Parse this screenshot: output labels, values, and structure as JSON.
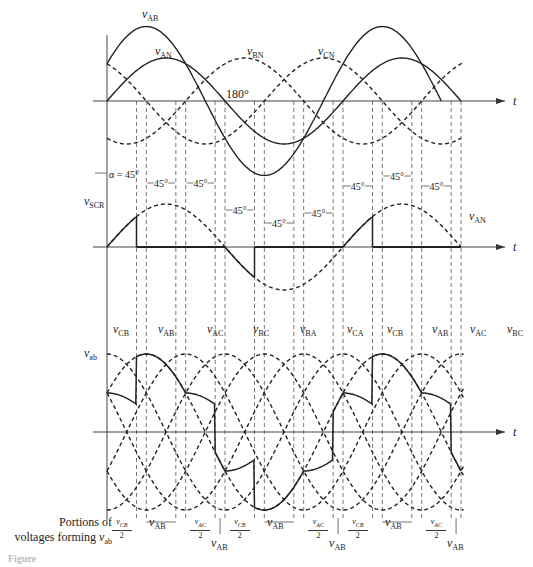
{
  "figure": {
    "caption_label": "Portions of",
    "caption_label_2": "voltages forming",
    "caption_var": "v",
    "caption_sub": "ab",
    "figure_caption": "Figure"
  },
  "panel_top": {
    "labels": {
      "vAB": {
        "v": "v",
        "sub": "AB"
      },
      "vAN": {
        "v": "v",
        "sub": "AN"
      },
      "vBN": {
        "v": "v",
        "sub": "BN"
      },
      "vCN": {
        "v": "v",
        "sub": "CN"
      },
      "deg180": "180°",
      "t": "t"
    }
  },
  "panel_scr": {
    "labels": {
      "alpha": "α = 45°",
      "vSCR": {
        "v": "v",
        "sub": "SCR"
      },
      "vAN": {
        "v": "v",
        "sub": "AN"
      },
      "t": "t",
      "intervals": [
        "45°",
        "45°",
        "45°",
        "45°",
        "45°",
        "45°",
        "45°",
        "45°",
        "45°"
      ]
    }
  },
  "panel_vab": {
    "labels": {
      "vab": {
        "v": "v",
        "sub": "ab"
      },
      "t": "t",
      "curves": [
        "CB",
        "AB",
        "AC",
        "BC",
        "BA",
        "CA",
        "CB",
        "AB",
        "AC",
        "BC"
      ]
    },
    "portions": [
      {
        "type": "half",
        "num": "v",
        "sub": "CB",
        "den": "2"
      },
      {
        "type": "full",
        "v": "v",
        "sub": "AB"
      },
      {
        "type": "half",
        "num": "v",
        "sub": "AC",
        "den": "2"
      },
      {
        "type": "arrow",
        "v": "v",
        "sub": "AB"
      },
      {
        "type": "half",
        "num": "v",
        "sub": "CB",
        "den": "2"
      },
      {
        "type": "full",
        "v": "v",
        "sub": "AB"
      },
      {
        "type": "half",
        "num": "v",
        "sub": "AC",
        "den": "2"
      },
      {
        "type": "arrow",
        "v": "v",
        "sub": "AB"
      },
      {
        "type": "half",
        "num": "v",
        "sub": "CB",
        "den": "2"
      },
      {
        "type": "full",
        "v": "v",
        "sub": "AB"
      },
      {
        "type": "half",
        "num": "v",
        "sub": "AC",
        "den": "2"
      },
      {
        "type": "arrow",
        "v": "v",
        "sub": "AB"
      }
    ]
  },
  "chart_data": {
    "type": "line",
    "xlabel": "t",
    "x_unit": "degrees",
    "x_range": [
      0,
      540
    ],
    "dashed_verticals_deg": [
      45,
      60,
      105,
      120,
      165,
      180,
      225,
      240,
      285,
      300,
      345,
      360,
      405,
      420,
      465,
      480,
      525,
      540
    ],
    "series": [
      {
        "panel": "top",
        "name": "v_AN",
        "style": "solid",
        "amplitude": 1.0,
        "phase_deg": 0
      },
      {
        "panel": "top",
        "name": "v_AB",
        "style": "solid",
        "amplitude": 1.732,
        "phase_deg": 30
      },
      {
        "panel": "top",
        "name": "v_BN",
        "style": "dashed",
        "amplitude": 1.0,
        "phase_deg": -120
      },
      {
        "panel": "top",
        "name": "v_CN",
        "style": "dashed",
        "amplitude": 1.0,
        "phase_deg": 120
      },
      {
        "panel": "middle",
        "name": "v_SCR",
        "style": "solid",
        "note": "conducts from α=45° to 180° portions"
      },
      {
        "panel": "middle",
        "name": "v_AN",
        "style": "dashed",
        "amplitude": 1.0,
        "phase_deg": 0
      },
      {
        "panel": "bottom",
        "name": "v_ab",
        "style": "solid",
        "note": "composed of v_CB/2, v_AB, v_AC/2 segments"
      },
      {
        "panel": "bottom",
        "name": "line voltages",
        "style": "dashed",
        "members": [
          "v_AB",
          "v_AC",
          "v_BC",
          "v_BA",
          "v_CA",
          "v_CB"
        ]
      }
    ],
    "annotations": [
      "180°",
      "α = 45°",
      "45° intervals"
    ]
  }
}
